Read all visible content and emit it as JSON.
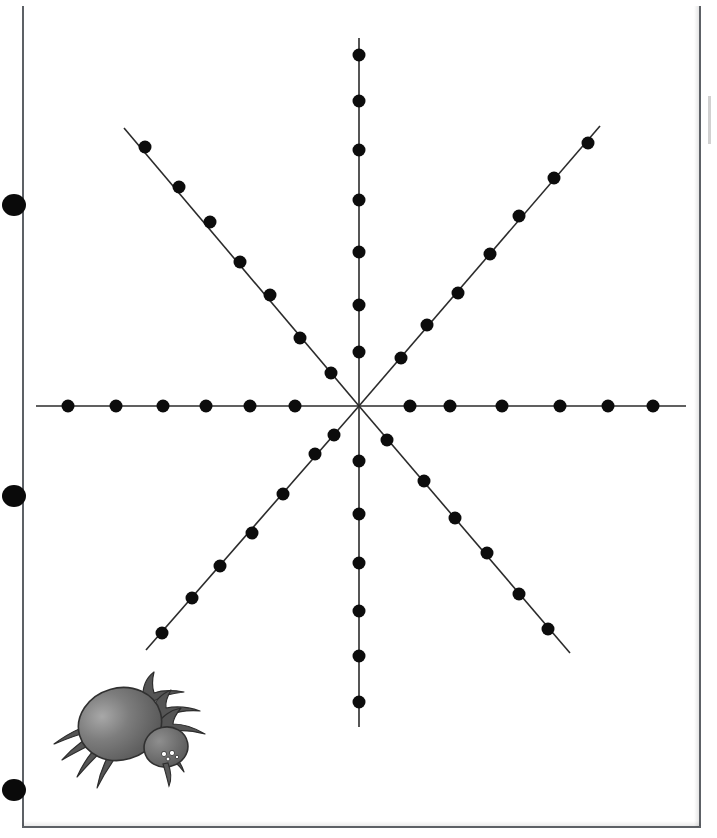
{
  "page": {
    "background_color": "#ffffff",
    "border_color": "#5d6166",
    "width": 717,
    "height": 838
  },
  "punch_holes": {
    "name": "three-ring-binder-holes",
    "color": "#0a0a0a",
    "positions": [
      {
        "cx": 14,
        "cy": 205
      },
      {
        "cx": 14,
        "cy": 496
      },
      {
        "cx": 14,
        "cy": 790
      }
    ]
  },
  "spider": {
    "name": "spider-illustration",
    "body_color": "#6e6e6e",
    "body_highlight_color": "#9a9a9a",
    "leg_color": "#4a4a4a",
    "outline_color": "#2d2d2d",
    "eye_color": "#ffffff",
    "facing": "right",
    "leg_count": 8
  },
  "chart_data": {
    "type": "scatter",
    "title": "",
    "subtitle": "",
    "xlabel": "",
    "ylabel": "",
    "grid": false,
    "legend": null,
    "annotations": [],
    "center": {
      "x": 359,
      "y": 406
    },
    "dot_color": "#0c0c0c",
    "line_color": "#2b2b2b",
    "dot_radius": 6.5,
    "xlim": [
      32,
      690
    ],
    "ylim": [
      40,
      715
    ],
    "total_dots": 53,
    "series": [
      {
        "name": "ray-west",
        "angle_deg": 180,
        "dot_count": 6,
        "line_end": {
          "x": 36,
          "y": 406
        },
        "points": [
          {
            "x": 68,
            "y": 406
          },
          {
            "x": 116,
            "y": 406
          },
          {
            "x": 163,
            "y": 406
          },
          {
            "x": 206,
            "y": 406
          },
          {
            "x": 250,
            "y": 406
          },
          {
            "x": 295,
            "y": 406
          }
        ]
      },
      {
        "name": "ray-east",
        "angle_deg": 0,
        "dot_count": 6,
        "line_end": {
          "x": 686,
          "y": 406
        },
        "points": [
          {
            "x": 410,
            "y": 406
          },
          {
            "x": 450,
            "y": 406
          },
          {
            "x": 502,
            "y": 406
          },
          {
            "x": 560,
            "y": 406
          },
          {
            "x": 608,
            "y": 406
          },
          {
            "x": 653,
            "y": 406
          }
        ]
      },
      {
        "name": "ray-north",
        "angle_deg": 90,
        "dot_count": 7,
        "line_end": {
          "x": 359,
          "y": 38
        },
        "points": [
          {
            "x": 359,
            "y": 55
          },
          {
            "x": 359,
            "y": 101
          },
          {
            "x": 359,
            "y": 150
          },
          {
            "x": 359,
            "y": 200
          },
          {
            "x": 359,
            "y": 252
          },
          {
            "x": 359,
            "y": 305
          },
          {
            "x": 359,
            "y": 352
          }
        ]
      },
      {
        "name": "ray-south",
        "angle_deg": 270,
        "dot_count": 6,
        "line_end": {
          "x": 359,
          "y": 727
        },
        "points": [
          {
            "x": 359,
            "y": 461
          },
          {
            "x": 359,
            "y": 514
          },
          {
            "x": 359,
            "y": 563
          },
          {
            "x": 359,
            "y": 611
          },
          {
            "x": 359,
            "y": 656
          },
          {
            "x": 359,
            "y": 702
          }
        ]
      },
      {
        "name": "ray-northwest",
        "angle_deg": 135,
        "dot_count": 7,
        "line_end": {
          "x": 124,
          "y": 128
        },
        "points": [
          {
            "x": 145,
            "y": 147
          },
          {
            "x": 179,
            "y": 187
          },
          {
            "x": 210,
            "y": 222
          },
          {
            "x": 240,
            "y": 262
          },
          {
            "x": 270,
            "y": 295
          },
          {
            "x": 300,
            "y": 338
          },
          {
            "x": 331,
            "y": 373
          }
        ]
      },
      {
        "name": "ray-northeast",
        "angle_deg": 45,
        "dot_count": 7,
        "line_end": {
          "x": 600,
          "y": 126
        },
        "points": [
          {
            "x": 588,
            "y": 143
          },
          {
            "x": 554,
            "y": 178
          },
          {
            "x": 519,
            "y": 216
          },
          {
            "x": 490,
            "y": 254
          },
          {
            "x": 458,
            "y": 293
          },
          {
            "x": 427,
            "y": 325
          },
          {
            "x": 401,
            "y": 358
          }
        ]
      },
      {
        "name": "ray-southwest",
        "angle_deg": 225,
        "dot_count": 7,
        "line_end": {
          "x": 146,
          "y": 650
        },
        "points": [
          {
            "x": 162,
            "y": 633
          },
          {
            "x": 192,
            "y": 598
          },
          {
            "x": 220,
            "y": 566
          },
          {
            "x": 252,
            "y": 533
          },
          {
            "x": 283,
            "y": 494
          },
          {
            "x": 315,
            "y": 454
          },
          {
            "x": 334,
            "y": 435
          }
        ]
      },
      {
        "name": "ray-southeast",
        "angle_deg": 315,
        "dot_count": 7,
        "line_end": {
          "x": 570,
          "y": 653
        },
        "points": [
          {
            "x": 387,
            "y": 440
          },
          {
            "x": 424,
            "y": 481
          },
          {
            "x": 455,
            "y": 518
          },
          {
            "x": 487,
            "y": 553
          },
          {
            "x": 519,
            "y": 594
          },
          {
            "x": 548,
            "y": 629
          }
        ]
      }
    ]
  }
}
